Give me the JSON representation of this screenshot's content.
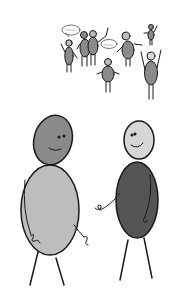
{
  "image": {
    "description": "Hand-drawn grayscale doodle: a crowd of small stick figures with oval bodies at top, two larger figures meeting at bottom",
    "background": "#ffffff"
  },
  "colors": {
    "outline": "#1a1a1a",
    "light_gray": "#bdbdbd",
    "mid_gray": "#8a8a8a",
    "dark_gray": "#555555",
    "pale_gray": "#d6d6d6"
  },
  "crowd": {
    "figure_count": 9,
    "speech_bubbles": [
      {
        "text": ""
      },
      {
        "text": ""
      }
    ]
  },
  "foreground": {
    "left_figure": {
      "head": "mid_gray",
      "body": "light_gray",
      "expression": "smile"
    },
    "right_figure": {
      "head": "pale_gray",
      "body": "dark_gray",
      "expression": "smile"
    }
  }
}
